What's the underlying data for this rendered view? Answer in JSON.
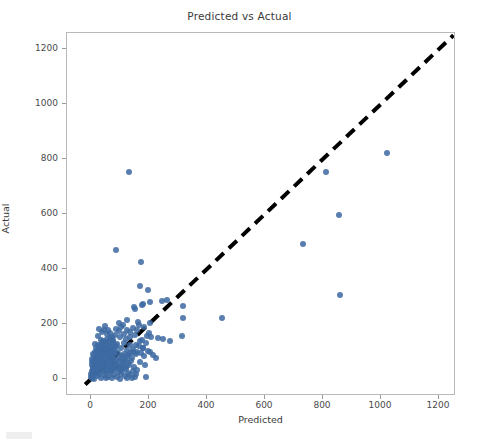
{
  "figure": {
    "title": "Predicted vs Actual",
    "background_color": "#ffffff",
    "marker_color": "#3d6aa2",
    "line_color": "#000000",
    "axis_color": "#b9b9b9"
  },
  "chart_data": {
    "type": "scatter",
    "title": "Predicted vs Actual",
    "xlabel": "Predicted",
    "ylabel": "Actual",
    "xlim": [
      -60,
      1320
    ],
    "ylim": [
      -110,
      1390
    ],
    "xticks": [
      0,
      200,
      400,
      600,
      800,
      1000,
      1200
    ],
    "yticks": [
      0,
      200,
      400,
      600,
      800,
      1000,
      1200
    ],
    "xticklabels": [
      "0",
      "200",
      "400",
      "600",
      "800",
      "1000",
      "1200"
    ],
    "yticklabels": [
      "0",
      "200",
      "400",
      "600",
      "800",
      "1000",
      "1200"
    ],
    "grid": false,
    "legend": null,
    "series": [
      {
        "name": "Predicted vs Actual points",
        "type": "scatter",
        "color": "#3d6aa2",
        "marker": "circle",
        "points": [
          [
            1242,
            1312
          ],
          [
            1022,
            822
          ],
          [
            812,
            752
          ],
          [
            855,
            596
          ],
          [
            730,
            490
          ],
          [
            857,
            306
          ],
          [
            452,
            221
          ],
          [
            318,
            222
          ],
          [
            316,
            265
          ],
          [
            313,
            157
          ],
          [
            274,
            139
          ],
          [
            261,
            286
          ],
          [
            249,
            146
          ],
          [
            246,
            283
          ],
          [
            232,
            148
          ],
          [
            206,
            151
          ],
          [
            205,
            205
          ],
          [
            203,
            281
          ],
          [
            197,
            324
          ],
          [
            188,
            6
          ],
          [
            186,
            50
          ],
          [
            182,
            190
          ],
          [
            178,
            271
          ],
          [
            176,
            268
          ],
          [
            172,
            425
          ],
          [
            170,
            338
          ],
          [
            166,
            196
          ],
          [
            163,
            208
          ],
          [
            160,
            180
          ],
          [
            158,
            100
          ],
          [
            156,
            90
          ],
          [
            152,
            161
          ],
          [
            150,
            254
          ],
          [
            147,
            262
          ],
          [
            144,
            97
          ],
          [
            141,
            78
          ],
          [
            138,
            66
          ],
          [
            136,
            172
          ],
          [
            133,
            122
          ],
          [
            131,
            752
          ],
          [
            129,
            88
          ],
          [
            127,
            60
          ],
          [
            125,
            215
          ],
          [
            123,
            104
          ],
          [
            121,
            147
          ],
          [
            119,
            42
          ],
          [
            117,
            70
          ],
          [
            115,
            131
          ],
          [
            113,
            92
          ],
          [
            111,
            197
          ],
          [
            109,
            58
          ],
          [
            107,
            84
          ],
          [
            105,
            112
          ],
          [
            103,
            38
          ],
          [
            101,
            154
          ],
          [
            99,
            75
          ],
          [
            97,
            66
          ],
          [
            95,
            203
          ],
          [
            93,
            95
          ],
          [
            91,
            49
          ],
          [
            89,
            128
          ],
          [
            87,
            470
          ],
          [
            86,
            69
          ],
          [
            85,
            181
          ],
          [
            84,
            110
          ],
          [
            83,
            44
          ],
          [
            82,
            160
          ],
          [
            81,
            87
          ],
          [
            80,
            55
          ],
          [
            79,
            123
          ],
          [
            78,
            98
          ],
          [
            77,
            36
          ],
          [
            76,
            141
          ],
          [
            75,
            72
          ],
          [
            74,
            107
          ],
          [
            73,
            61
          ],
          [
            72,
            152
          ],
          [
            71,
            89
          ],
          [
            70,
            30
          ],
          [
            69,
            118
          ],
          [
            68,
            80
          ],
          [
            67,
            136
          ],
          [
            66,
            53
          ],
          [
            65,
            99
          ],
          [
            64,
            167
          ],
          [
            63,
            74
          ],
          [
            62,
            41
          ],
          [
            61,
            113
          ],
          [
            60,
            86
          ],
          [
            59,
            129
          ],
          [
            58,
            64
          ],
          [
            57,
            102
          ],
          [
            56,
            28
          ],
          [
            55,
            145
          ],
          [
            54,
            79
          ],
          [
            53,
            117
          ],
          [
            52,
            58
          ],
          [
            51,
            93
          ],
          [
            50,
            134
          ],
          [
            49,
            46
          ],
          [
            48,
            108
          ],
          [
            47,
            71
          ],
          [
            46,
            124
          ],
          [
            45,
            85
          ],
          [
            44,
            33
          ],
          [
            43,
            100
          ],
          [
            42,
            140
          ],
          [
            41,
            62
          ],
          [
            40,
            96
          ],
          [
            39,
            115
          ],
          [
            38,
            51
          ],
          [
            37,
            131
          ],
          [
            36,
            76
          ],
          [
            35,
            105
          ],
          [
            34,
            39
          ],
          [
            33,
            88
          ],
          [
            32,
            120
          ],
          [
            31,
            67
          ],
          [
            30,
            94
          ],
          [
            29,
            26
          ],
          [
            28,
            110
          ],
          [
            27,
            57
          ],
          [
            26,
            82
          ],
          [
            25,
            125
          ],
          [
            24,
            45
          ],
          [
            23,
            73
          ],
          [
            22,
            101
          ],
          [
            21,
            34
          ],
          [
            20,
            90
          ],
          [
            19,
            60
          ],
          [
            18,
            112
          ],
          [
            17,
            48
          ],
          [
            16,
            78
          ],
          [
            15,
            22
          ],
          [
            14,
            97
          ],
          [
            13,
            55
          ],
          [
            12,
            84
          ],
          [
            11,
            37
          ],
          [
            10,
            68
          ],
          [
            9,
            15
          ],
          [
            8,
            91
          ],
          [
            7,
            43
          ],
          [
            6,
            25
          ],
          [
            5,
            71
          ],
          [
            4,
            12
          ],
          [
            3,
            52
          ],
          [
            2,
            30
          ],
          [
            1,
            8
          ],
          [
            0,
            18
          ],
          [
            2,
            62
          ],
          [
            5,
            4
          ],
          [
            8,
            35
          ],
          [
            12,
            0
          ],
          [
            16,
            59
          ],
          [
            20,
            11
          ],
          [
            24,
            66
          ],
          [
            28,
            20
          ],
          [
            32,
            41
          ],
          [
            36,
            5
          ],
          [
            40,
            50
          ],
          [
            44,
            15
          ],
          [
            48,
            27
          ],
          [
            52,
            3
          ],
          [
            56,
            38
          ],
          [
            60,
            9
          ],
          [
            64,
            21
          ],
          [
            68,
            47
          ],
          [
            72,
            2
          ],
          [
            76,
            31
          ],
          [
            80,
            13
          ],
          [
            84,
            56
          ],
          [
            88,
            7
          ],
          [
            92,
            24
          ],
          [
            96,
            40
          ],
          [
            100,
            1
          ],
          [
            104,
            17
          ],
          [
            108,
            29
          ],
          [
            112,
            45
          ],
          [
            116,
            10
          ],
          [
            120,
            35
          ],
          [
            124,
            5
          ],
          [
            128,
            23
          ],
          [
            132,
            52
          ],
          [
            136,
            14
          ],
          [
            140,
            3
          ],
          [
            144,
            28
          ],
          [
            148,
            44
          ],
          [
            152,
            8
          ],
          [
            156,
            19
          ],
          [
            160,
            33
          ],
          [
            164,
            120
          ],
          [
            168,
            61
          ],
          [
            172,
            95
          ],
          [
            176,
            143
          ],
          [
            180,
            112
          ],
          [
            184,
            84
          ],
          [
            188,
            130
          ],
          [
            192,
            158
          ],
          [
            196,
            103
          ],
          [
            200,
            168
          ],
          [
            155,
            122
          ],
          [
            145,
            108
          ],
          [
            135,
            93
          ],
          [
            125,
            79
          ],
          [
            115,
            64
          ],
          [
            105,
            50
          ],
          [
            95,
            37
          ],
          [
            85,
            119
          ],
          [
            75,
            133
          ],
          [
            65,
            149
          ],
          [
            55,
            164
          ],
          [
            45,
            178
          ],
          [
            35,
            143
          ],
          [
            25,
            155
          ],
          [
            15,
            128
          ],
          [
            95,
            175
          ],
          [
            105,
            188
          ],
          [
            115,
            163
          ],
          [
            125,
            177
          ],
          [
            135,
            151
          ],
          [
            145,
            184
          ],
          [
            58,
            178
          ],
          [
            48,
            193
          ],
          [
            38,
            171
          ],
          [
            28,
            182
          ],
          [
            205,
            99
          ],
          [
            215,
            88
          ],
          [
            225,
            76
          ],
          [
            178,
            112
          ],
          [
            168,
            140
          ]
        ]
      }
    ],
    "reference_line": {
      "name": "identity-line",
      "style": "dashed",
      "color": "#000000",
      "linewidth": 4,
      "from": [
        -20,
        -20
      ],
      "to": [
        1250,
        1250
      ]
    }
  },
  "axes": {
    "xlabel": "Predicted",
    "ylabel": "Actual"
  }
}
